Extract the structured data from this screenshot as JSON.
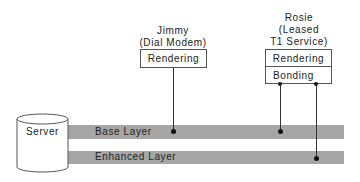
{
  "diagram": {
    "server": {
      "label": "Server"
    },
    "layers": [
      {
        "label": "Base Layer"
      },
      {
        "label": "Enhanced Layer"
      }
    ],
    "clients": [
      {
        "name": "Jimmy",
        "connection": "(Dial Modem)",
        "modules": [
          "Rendering"
        ],
        "subscribed_layers": [
          "Base Layer"
        ]
      },
      {
        "name": "Rosie",
        "connection_line1": "(Leased",
        "connection_line2": "T1 Service)",
        "modules": [
          "Rendering",
          "Bonding"
        ],
        "subscribed_layers": [
          "Base Layer",
          "Enhanced Layer"
        ]
      }
    ],
    "colors": {
      "layer_bar": "#a6a6a6",
      "line": "#333333",
      "box_border": "#555555"
    }
  }
}
